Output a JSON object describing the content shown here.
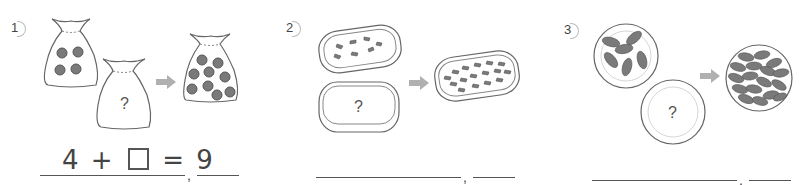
{
  "worksheet": {
    "problems": [
      {
        "number": "1",
        "container": "bag",
        "first_count": 4,
        "unknown_label": "?",
        "result_count": 9,
        "equation": {
          "left": "4",
          "op": "+",
          "eq": "=",
          "right": "9"
        },
        "comma": ","
      },
      {
        "number": "2",
        "container": "tray",
        "first_count": 7,
        "unknown_label": "?",
        "result_count": 16,
        "comma": ","
      },
      {
        "number": "3",
        "container": "plate",
        "first_count": 6,
        "unknown_label": "?",
        "result_count": 17,
        "comma": ","
      }
    ],
    "colors": {
      "item_fill": "#7a7a7a",
      "outline": "#555555",
      "arrow": "#b0b0b0",
      "text": "#444444"
    }
  }
}
